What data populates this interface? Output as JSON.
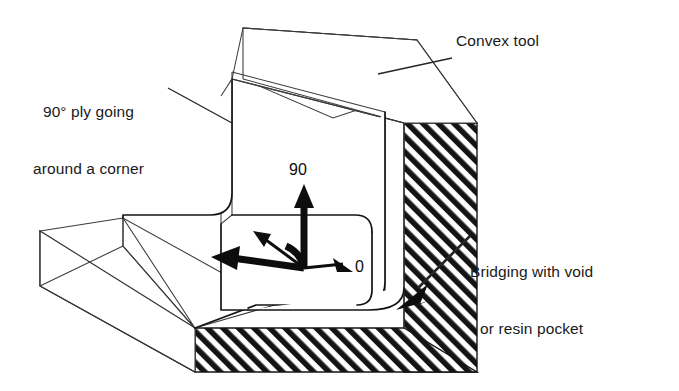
{
  "figure": {
    "background_color": "#ffffff",
    "line_color": "#2b2b2b",
    "hatch_color": "#141414",
    "width": 679,
    "height": 391
  },
  "labels": {
    "ply_callout": "90° ply going\naround a corner",
    "ply_callout_line1": "90° ply going",
    "ply_callout_line2": "around a corner",
    "convex_tool": "Convex tool",
    "bridging": "Bridging with void\nor resin pocket",
    "bridging_line1": "Bridging with void",
    "bridging_line2": "or resin pocket"
  },
  "axes": {
    "ninety_label": "90",
    "zero_label": "0",
    "ninety_description": "curved arrow pointing up, 90 degree fibre direction",
    "zero_description": "arrow pointing down-right, 0 degree fibre direction"
  },
  "annotations": [
    {
      "name": "ply-going-around-corner",
      "text": "90° ply going around a corner",
      "points_to": "inner ply vertical wall"
    },
    {
      "name": "convex-tool",
      "text": "Convex tool",
      "points_to": "hatched tool body upper edge"
    },
    {
      "name": "bridging-void",
      "text": "Bridging with void or resin pocket",
      "points_to": "inner radius corner between ply and tool"
    }
  ]
}
